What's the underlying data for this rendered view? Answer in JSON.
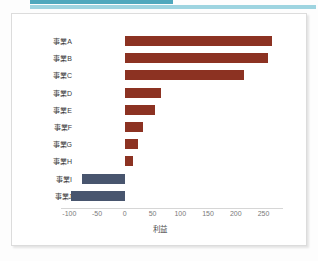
{
  "decor": {
    "accent_dark": "#4fa8bd",
    "accent_light": "#9ed4e0"
  },
  "chart_data": {
    "type": "bar",
    "orientation": "horizontal",
    "title": "",
    "subtitle": "",
    "xlabel": "利益",
    "ylabel": "",
    "categories": [
      "事業A",
      "事業B",
      "事業C",
      "事業D",
      "事業E",
      "事業F",
      "事業G",
      "事業H",
      "事業I",
      "事業J"
    ],
    "values": [
      265,
      258,
      215,
      65,
      55,
      33,
      24,
      15,
      -78,
      -97
    ],
    "series": [
      {
        "name": "利益",
        "values": [
          265,
          258,
          215,
          65,
          55,
          33,
          24,
          15,
          -78,
          -97
        ]
      }
    ],
    "xlim": [
      -115,
      285
    ],
    "xticks": [
      -100,
      -50,
      0,
      50,
      100,
      150,
      200,
      250
    ],
    "xticklabels": [
      "-100",
      "-50",
      "0",
      "50",
      "100",
      "150",
      "200",
      "250"
    ],
    "grid": false,
    "legend": false,
    "legend_position": "none",
    "colors": {
      "positive": "#8c3222",
      "negative": "#48556e",
      "axis_text": "#7a7a7a",
      "label_text": "#3a3a3a",
      "axis_line": "#d6d6d6"
    }
  }
}
